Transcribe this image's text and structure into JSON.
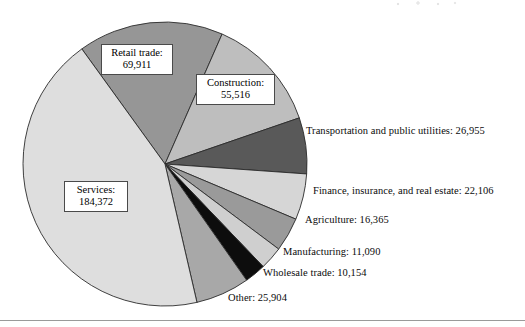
{
  "figure": {
    "background_color": "#ffffff",
    "rule_color": "#9a9a9a"
  },
  "chart_data": {
    "type": "pie",
    "title": "",
    "subtitle": "",
    "xlabel": "",
    "ylabel": "",
    "total": 422373,
    "legend_position": "none",
    "grid": false,
    "label_format": "name: value",
    "categories": [
      "Retail trade",
      "Construction",
      "Transportation and public utilities",
      "Finance, insurance, and real estate",
      "Agriculture",
      "Manufacturing",
      "Wholesale trade",
      "Other",
      "Services"
    ],
    "values": [
      69911,
      55516,
      26955,
      22106,
      16365,
      11090,
      10154,
      25904,
      184372
    ],
    "value_labels": [
      "69,911",
      "55,516",
      "26,955",
      "22,106",
      "16,365",
      "11,090",
      "10,154",
      "25,904",
      "184,372"
    ],
    "slice_colors": [
      "#969696",
      "#bebebe",
      "#595959",
      "#d6d6d6",
      "#9a9a9a",
      "#cfcfcf",
      "#0d0d0d",
      "#a8a8a8",
      "#dedede"
    ],
    "slice_edge_color": "#2b2b2b",
    "start_angle_deg": -125.86,
    "direction": "clockwise",
    "center": {
      "x": 165,
      "y": 164
    },
    "radius": 142
  },
  "callouts": [
    {
      "name": "Retail trade:",
      "value": "69,911"
    },
    {
      "name": "Construction:",
      "value": "55,516"
    },
    {
      "name": "Services:",
      "value": "184,372"
    }
  ],
  "outside_labels": [
    {
      "text": "Transportation and public utilities: 26,955"
    },
    {
      "text": "Finance, insurance, and real estate: 22,106"
    },
    {
      "text": "Agriculture: 16,365"
    },
    {
      "text": "Manufacturing: 11,090"
    },
    {
      "text": "Wholesale trade: 10,154"
    },
    {
      "text": "Other: 25,904"
    }
  ]
}
